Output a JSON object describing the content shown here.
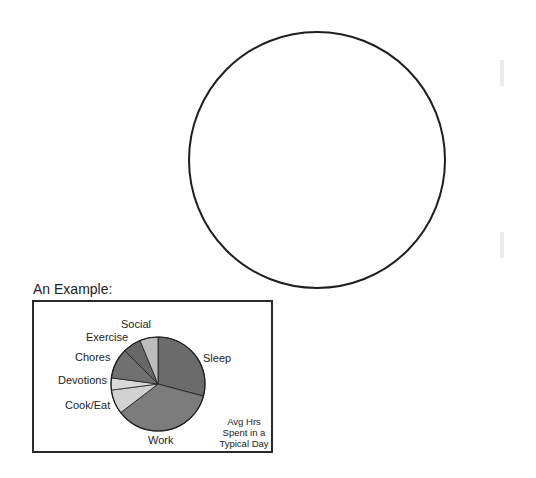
{
  "worksheet": {
    "blank_circle_label": "",
    "example_title": "An Example:",
    "example_note": [
      "Avg Hrs",
      "Spent in a",
      "Typical Day"
    ]
  },
  "chart_data": {
    "type": "pie",
    "title": "Avg Hrs Spent in a Typical Day",
    "categories": [
      "Sleep",
      "Work",
      "Cook/Eat",
      "Devotions",
      "Chores",
      "Exercise",
      "Social"
    ],
    "values": [
      7,
      8.5,
      2,
      1,
      2.5,
      1.5,
      1.5
    ],
    "unit": "hours",
    "total": 24,
    "start_angle": "12 o'clock, clockwise",
    "colors": [
      "#6b6b6b",
      "#7c7c7c",
      "#d2d2d2",
      "#d9d9d9",
      "#707070",
      "#676767",
      "#bdbdbd"
    ],
    "legend": "labels placed beside slices"
  },
  "labels": {
    "social": "Social",
    "exercise": "Exercise",
    "chores": "Chores",
    "sleep": "Sleep",
    "devotions": "Devotions",
    "cook_eat": "Cook/Eat",
    "work": "Work"
  }
}
